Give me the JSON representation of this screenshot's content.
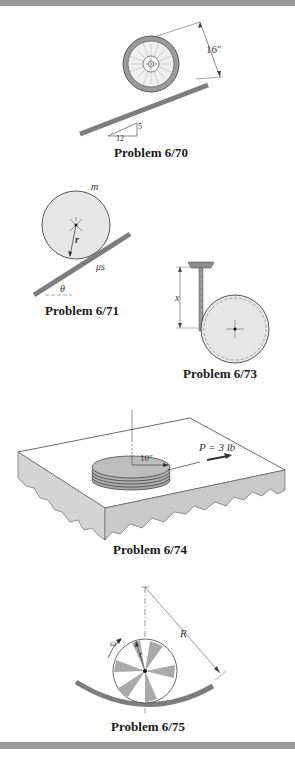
{
  "problems": [
    {
      "id": "6/70",
      "caption": "Problem 6/70",
      "labels": {
        "dimension": "16″",
        "slope_run": "12",
        "slope_rise": "5"
      }
    },
    {
      "id": "6/71",
      "caption": "Problem 6/71",
      "labels": {
        "mass": "m",
        "radius": "r",
        "friction": "μs",
        "angle": "θ"
      }
    },
    {
      "id": "6/73",
      "caption": "Problem 6/73",
      "labels": {
        "distance": "x"
      }
    },
    {
      "id": "6/74",
      "caption": "Problem 6/74",
      "labels": {
        "radius": "10″",
        "force": "P = 3 lb"
      }
    },
    {
      "id": "6/75",
      "caption": "Problem 6/75",
      "labels": {
        "omega": "ω",
        "small_radius": "r",
        "large_radius": "R"
      }
    }
  ],
  "colors": {
    "border_bar": "#9a9a9a",
    "disk_fill": "#e6e6e6",
    "incline": "#8a8a8a",
    "slab_side": "#d4d4d4"
  }
}
